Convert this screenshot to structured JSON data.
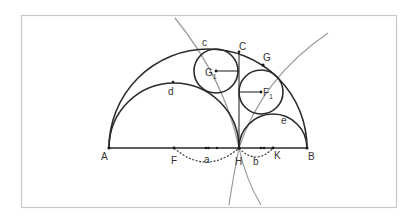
{
  "diagram": {
    "type": "arbelos-twin-circles",
    "colors": {
      "stroke": "#2b2b2b",
      "construction": "#9a9a9a",
      "frame": "#c8c8c8",
      "label": "#333333"
    },
    "labels": {
      "A": "A",
      "B": "B",
      "C": "C",
      "G": "G",
      "G1_main": "G",
      "G1_sub": "1",
      "F1_main": "F",
      "F1_sub": "1",
      "F": "F",
      "H": "H",
      "K": "K",
      "a": "a",
      "b": "b",
      "c": "c",
      "d": "d",
      "e": "e"
    }
  }
}
